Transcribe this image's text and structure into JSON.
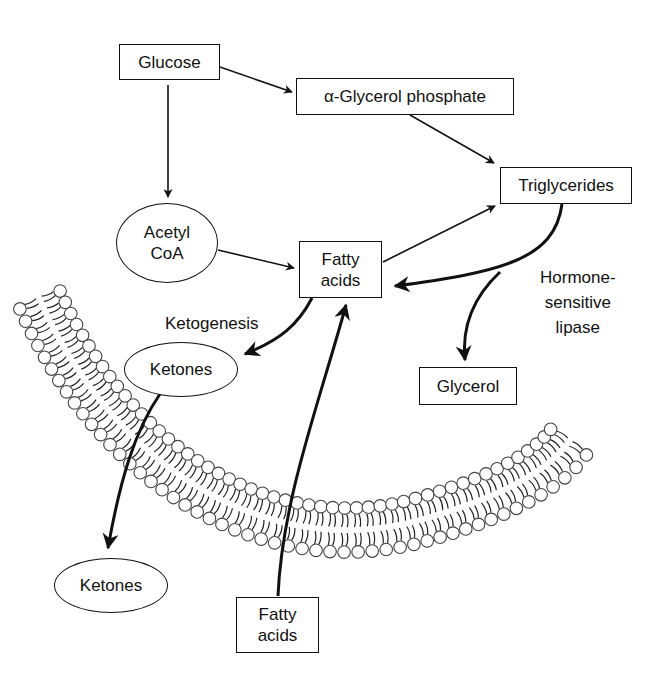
{
  "diagram": {
    "nodes": {
      "glucose": "Glucose",
      "glycerol_phosphate": "α-Glycerol phosphate",
      "triglycerides": "Triglycerides",
      "acetyl_coa": "Acetyl\nCoA",
      "fatty_acids_inner": "Fatty\nacids",
      "ketones_inner": "Ketones",
      "glycerol": "Glycerol",
      "ketones_outer": "Ketones",
      "fatty_acids_outer": "Fatty\nacids"
    },
    "labels": {
      "ketogenesis": "Ketogenesis",
      "hormone_sensitive_lipase": "Hormone-\nsensitive\nlipase"
    },
    "edges": [
      {
        "from": "Glucose",
        "to": "α-Glycerol phosphate"
      },
      {
        "from": "Glucose",
        "to": "Acetyl CoA"
      },
      {
        "from": "α-Glycerol phosphate",
        "to": "Triglycerides"
      },
      {
        "from": "Acetyl CoA",
        "to": "Fatty acids"
      },
      {
        "from": "Fatty acids",
        "to": "Triglycerides"
      },
      {
        "from": "Triglycerides",
        "to": "Fatty acids",
        "label": "Hormone-sensitive lipase"
      },
      {
        "from": "Triglycerides",
        "to": "Glycerol"
      },
      {
        "from": "Fatty acids",
        "to": "Ketones",
        "label": "Ketogenesis"
      },
      {
        "from": "Ketones",
        "to": "Ketones (outside cell)"
      },
      {
        "from": "Fatty acids (outside cell)",
        "to": "Fatty acids"
      }
    ]
  }
}
